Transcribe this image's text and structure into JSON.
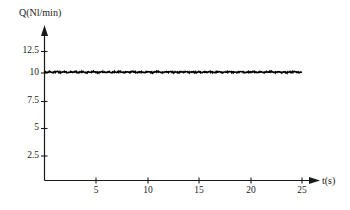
{
  "figure": {
    "background_color": "#ffffff",
    "line_color": "#000000",
    "axis_color": "#1a1a1a"
  },
  "chart_data": {
    "type": "line",
    "title": "",
    "subtitle": "",
    "xlabel": "t(s)",
    "ylabel": "Q(Nl/min)",
    "xlim": [
      0,
      25.8
    ],
    "ylim": [
      0,
      13.6
    ],
    "xticks": [
      5,
      10,
      15,
      20,
      25
    ],
    "yticks": [
      2.5,
      5,
      7.5,
      10,
      12.5
    ],
    "xtick_labels": [
      "5",
      "10",
      "15",
      "20",
      "25"
    ],
    "ytick_labels": [
      "2.5",
      "5",
      "7.5",
      "10",
      "12.5"
    ],
    "grid": false,
    "legend": null,
    "annotations": [],
    "series": [
      {
        "name": "Q",
        "style": "noisy-flat-line",
        "mean": 10.1,
        "noise_amplitude": 0.12,
        "x_start": 0,
        "x_end": 25,
        "x": [
          0,
          0.25,
          0.5,
          0.75,
          1,
          1.25,
          1.5,
          1.75,
          2,
          2.25,
          2.5,
          2.75,
          3,
          3.25,
          3.5,
          3.75,
          4,
          4.25,
          4.5,
          4.75,
          5,
          5.25,
          5.5,
          5.75,
          6,
          6.25,
          6.5,
          6.75,
          7,
          7.25,
          7.5,
          7.75,
          8,
          8.25,
          8.5,
          8.75,
          9,
          9.25,
          9.5,
          9.75,
          10,
          10.25,
          10.5,
          10.75,
          11,
          11.25,
          11.5,
          11.75,
          12,
          12.25,
          12.5,
          12.75,
          13,
          13.25,
          13.5,
          13.75,
          14,
          14.25,
          14.5,
          14.75,
          15,
          15.25,
          15.5,
          15.75,
          16,
          16.25,
          16.5,
          16.75,
          17,
          17.25,
          17.5,
          17.75,
          18,
          18.25,
          18.5,
          18.75,
          19,
          19.25,
          19.5,
          19.75,
          20,
          20.25,
          20.5,
          20.75,
          21,
          21.25,
          21.5,
          21.75,
          22,
          22.25,
          22.5,
          22.75,
          23,
          23.25,
          23.5,
          23.75,
          24,
          24.25,
          24.5,
          24.75,
          25
        ],
        "values": [
          10.14,
          10.06,
          10.17,
          10.04,
          10.12,
          10.19,
          10.05,
          10.1,
          10.16,
          10.03,
          10.13,
          10.08,
          10.18,
          10.05,
          10.11,
          10.15,
          10.02,
          10.12,
          10.07,
          10.17,
          10.09,
          10.04,
          10.15,
          10.11,
          10.06,
          10.16,
          10.03,
          10.13,
          10.08,
          10.18,
          10.1,
          10.05,
          10.14,
          10.07,
          10.17,
          10.12,
          10.04,
          10.15,
          10.09,
          10.06,
          10.16,
          10.11,
          10.03,
          10.13,
          10.18,
          10.08,
          10.05,
          10.14,
          10.1,
          10.17,
          10.06,
          10.12,
          10.04,
          10.15,
          10.09,
          10.18,
          10.07,
          10.13,
          10.11,
          10.05,
          10.16,
          10.03,
          10.14,
          10.08,
          10.17,
          10.1,
          10.06,
          10.12,
          10.15,
          10.04,
          10.13,
          10.09,
          10.18,
          10.07,
          10.11,
          10.05,
          10.16,
          10.14,
          10.03,
          10.12,
          10.08,
          10.17,
          10.1,
          10.06,
          10.15,
          10.04,
          10.13,
          10.11,
          10.18,
          10.07,
          10.09,
          10.16,
          10.05,
          10.14,
          10.03,
          10.12,
          10.08,
          10.17,
          10.1,
          10.06,
          10.13
        ]
      }
    ]
  }
}
